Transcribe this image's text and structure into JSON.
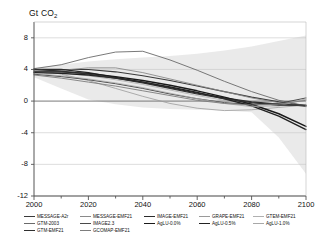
{
  "chart_data": {
    "type": "line",
    "title": "Gt CO2",
    "ylabel": "Gt CO2",
    "xlabel": "",
    "xlim": [
      2000,
      2100
    ],
    "ylim": [
      -12,
      10
    ],
    "yticks": [
      8,
      4,
      0,
      -4,
      -8,
      -12
    ],
    "xticks": [
      2000,
      2020,
      2040,
      2060,
      2080,
      2100
    ],
    "grid": true,
    "legend_position": "bottom",
    "x": [
      2000,
      2010,
      2020,
      2030,
      2040,
      2050,
      2060,
      2070,
      2080,
      2090,
      2100
    ],
    "band": {
      "name": "SRES range",
      "color": "#d9d9d9",
      "upper": [
        4.2,
        4.6,
        5.0,
        5.3,
        5.5,
        5.7,
        6.0,
        6.4,
        6.9,
        7.6,
        8.3
      ],
      "lower": [
        3.0,
        1.6,
        0.2,
        -0.4,
        -0.8,
        -1.0,
        -1.1,
        -1.2,
        -1.4,
        -4.6,
        -9.2
      ]
    },
    "series": [
      {
        "name": "MESSAGE-A2r",
        "values": [
          3.9,
          4.0,
          4.0,
          3.7,
          3.2,
          2.6,
          1.9,
          1.2,
          0.5,
          -0.1,
          -0.6
        ]
      },
      {
        "name": "MESSAGE-EMF21",
        "values": [
          3.8,
          3.9,
          4.2,
          4.2,
          3.6,
          2.8,
          2.0,
          1.2,
          0.4,
          -0.2,
          -0.7
        ]
      },
      {
        "name": "IMAGE-EMF21",
        "values": [
          4.0,
          4.0,
          3.6,
          3.0,
          2.4,
          1.7,
          1.0,
          0.4,
          -0.1,
          -0.4,
          -0.6
        ]
      },
      {
        "name": "GRAPE-EMF21",
        "values": [
          4.1,
          3.4,
          2.6,
          1.6,
          0.6,
          -0.3,
          -0.9,
          -1.2,
          -1.1,
          -0.8,
          -0.5
        ]
      },
      {
        "name": "GTEM-EMF21",
        "values": [
          3.9,
          3.6,
          3.2,
          2.7,
          2.1,
          1.4,
          0.7,
          0.1,
          -0.4,
          -0.6,
          0.2
        ]
      },
      {
        "name": "GTM-2003",
        "values": [
          4.1,
          4.6,
          5.5,
          6.2,
          6.3,
          5.2,
          3.9,
          2.5,
          1.2,
          0.1,
          -0.6
        ]
      },
      {
        "name": "IMAGE2.3",
        "values": [
          3.4,
          3.1,
          2.7,
          2.2,
          1.6,
          0.9,
          0.3,
          -0.2,
          -0.4,
          -0.3,
          0.4
        ]
      },
      {
        "name": "AgLU-0.0%",
        "values": [
          3.7,
          3.7,
          3.5,
          3.1,
          2.6,
          2.0,
          1.3,
          0.5,
          -0.4,
          -1.6,
          -3.2
        ]
      },
      {
        "name": "AgLU-0.5%",
        "values": [
          3.6,
          3.5,
          3.3,
          2.9,
          2.4,
          1.8,
          1.1,
          0.3,
          -0.6,
          -1.9,
          -3.6
        ]
      },
      {
        "name": "AgLU-1.0%",
        "values": [
          3.5,
          3.2,
          2.8,
          2.3,
          1.7,
          1.0,
          0.3,
          -0.3,
          -0.7,
          -0.6,
          0.3
        ]
      },
      {
        "name": "GTM-EMF21",
        "values": [
          4.0,
          3.8,
          3.4,
          2.9,
          2.3,
          1.6,
          0.9,
          0.3,
          -0.2,
          -0.5,
          -0.5
        ]
      },
      {
        "name": "GCOMAP-EMF21",
        "values": [
          3.3,
          2.9,
          2.4,
          1.9,
          1.3,
          0.7,
          0.1,
          -0.3,
          -0.5,
          -0.4,
          0.1
        ]
      }
    ]
  },
  "legend": {
    "sres_label": "SRES range",
    "items": [
      {
        "label": "MESSAGE-A2r",
        "color": "#3a3a3a",
        "width": 1.1,
        "dash": "none"
      },
      {
        "label": "MESSAGE-EMF21",
        "color": "#8a8a8a",
        "width": 0.9,
        "dash": "none"
      },
      {
        "label": "IMAGE-EMF21",
        "color": "#2b2b2b",
        "width": 1.3,
        "dash": "none"
      },
      {
        "label": "GRAPE-EMF21",
        "color": "#9a9a9a",
        "width": 0.8,
        "dash": "none"
      },
      {
        "label": "GTEM-EMF21",
        "color": "#b0b0b0",
        "width": 0.8,
        "dash": "none"
      },
      {
        "label": "GTM-2003",
        "color": "#6a6a6a",
        "width": 0.9,
        "dash": "none"
      },
      {
        "label": "IMAGE2.3",
        "color": "#4a4a4a",
        "width": 1.0,
        "dash": "none"
      },
      {
        "label": "AgLU-0.0%",
        "color": "#1a1a1a",
        "width": 1.4,
        "dash": "none"
      },
      {
        "label": "AgLU-0.5%",
        "color": "#222222",
        "width": 1.4,
        "dash": "none"
      },
      {
        "label": "AgLU-1.0%",
        "color": "#a8a8a8",
        "width": 0.8,
        "dash": "none"
      },
      {
        "label": "GTM-EMF21",
        "color": "#2f2f2f",
        "width": 1.2,
        "dash": "none"
      },
      {
        "label": "GCOMAP-EMF21",
        "color": "#7d7d7d",
        "width": 0.9,
        "dash": "none"
      }
    ]
  }
}
